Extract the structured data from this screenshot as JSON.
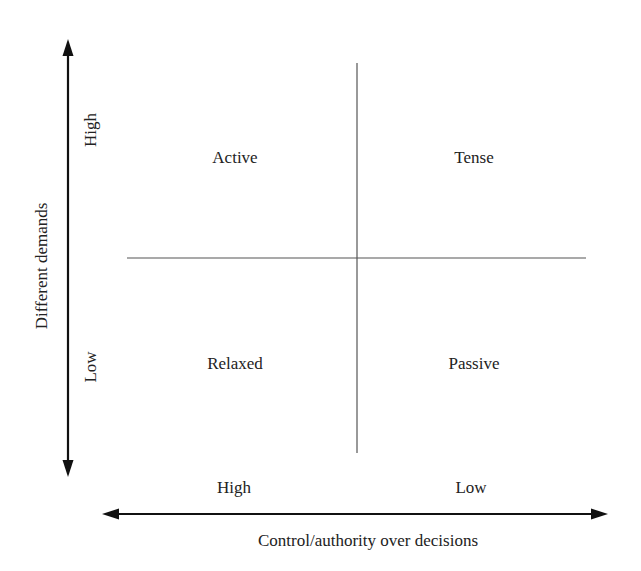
{
  "diagram": {
    "type": "2x2 quadrant matrix",
    "y_axis": {
      "label": "Different demands",
      "high_label": "High",
      "low_label": "Low"
    },
    "x_axis": {
      "label": "Control/authority over decisions",
      "high_label": "High",
      "low_label": "Low"
    },
    "quadrants": {
      "top_left": "Active",
      "top_right": "Tense",
      "bottom_left": "Relaxed",
      "bottom_right": "Passive"
    },
    "colors": {
      "line": "#555555",
      "arrow": "#111111",
      "text": "#222222",
      "background": "#ffffff"
    }
  }
}
